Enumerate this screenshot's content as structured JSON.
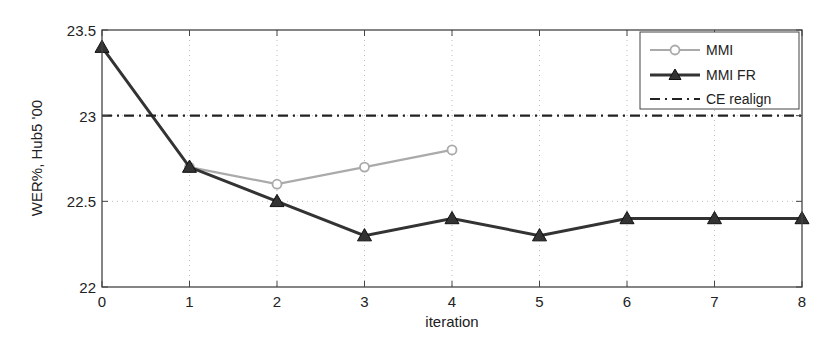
{
  "chart_data": {
    "type": "line",
    "title": "",
    "xlabel": "iteration",
    "ylabel": "WER%, Hub5 '00",
    "xlim": [
      0,
      8
    ],
    "ylim": [
      22,
      23.5
    ],
    "xticks": [
      0,
      1,
      2,
      3,
      4,
      5,
      6,
      7,
      8
    ],
    "yticks": [
      22,
      22.5,
      23,
      23.5
    ],
    "ytick_labels": [
      "22",
      "22.5",
      "23",
      "23.5"
    ],
    "grid": "dotted",
    "legend_position": "upper right",
    "series": [
      {
        "name": "MMI",
        "color": "#aaaaaa",
        "marker": "circle",
        "x": [
          1,
          2,
          3,
          4
        ],
        "values": [
          22.7,
          22.6,
          22.7,
          22.8
        ]
      },
      {
        "name": "MMI FR",
        "color": "#333333",
        "marker": "triangle",
        "x": [
          0,
          1,
          2,
          3,
          4,
          5,
          6,
          7,
          8
        ],
        "values": [
          23.4,
          22.7,
          22.5,
          22.3,
          22.4,
          22.3,
          22.4,
          22.4,
          22.4
        ]
      },
      {
        "name": "CE realign",
        "color": "#222222",
        "style": "dash-dot",
        "x": [
          0,
          8
        ],
        "values": [
          23.0,
          23.0
        ]
      }
    ]
  }
}
